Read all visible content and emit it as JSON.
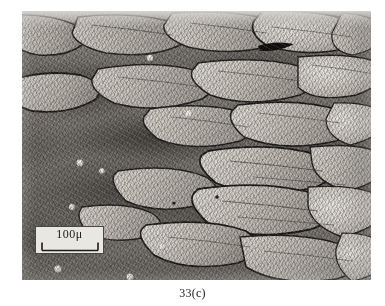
{
  "figure": {
    "caption": "33(c)",
    "kind": "optical-micrograph",
    "plate": {
      "left": 22,
      "top": 11,
      "width": 349,
      "height": 269
    }
  },
  "scale_bar": {
    "label": "100μ",
    "value": 100,
    "unit": "μ",
    "box_background": "#e9e7e1",
    "box_border": "#4a4743",
    "tick_color": "#1c1a18",
    "position": "lower-left"
  },
  "palette": {
    "page_background": "#ffffff",
    "plate_mid_tone": "#8e8e8e",
    "dendrite_highlight": "#d8d4cc",
    "dendrite_core": "#c3bfb7",
    "boundary_dark": "#221f1d",
    "matrix_dark": "#5d5a56",
    "caption_text": "#1b1b1b"
  },
  "features": {
    "inclusion_note": "dark elongated inclusion upper-right",
    "bright_droplets_note": "small bright spherical particles along cell tips"
  }
}
